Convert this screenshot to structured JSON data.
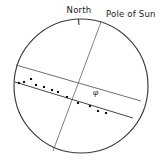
{
  "figure": {
    "name": "solar-disk-sunspot-diagram",
    "background_color": "#ffffff",
    "ink_color": "#2b2b2b"
  },
  "labels": {
    "north": "North",
    "pole_of_sun": "Pole of Sun",
    "angle_symbol": "φ"
  },
  "disk": {
    "center_x": 81,
    "center_y": 86,
    "radius": 67,
    "stroke_color": "#3a3a3a"
  },
  "north_tick": {
    "x": 78.5,
    "y_outer": 19,
    "y_inner": 25
  },
  "rotation_axis": {
    "label": "Pole of Sun",
    "x1": 101,
    "y1": 22,
    "x2": 53,
    "y2": 151,
    "stroke_color": "#6a6a6a"
  },
  "chord_upper": {
    "x1": 16,
    "y1": 65,
    "x2": 141,
    "y2": 101
  },
  "chord_lower_fit": {
    "x1": 15,
    "y1": 82,
    "x2": 133,
    "y2": 118
  },
  "angle_marker": {
    "vertex_x": 81,
    "vertex_y": 86,
    "arc_radius": 17,
    "symbol": "φ",
    "symbol_x": 98,
    "symbol_y": 93
  },
  "chart_data": {
    "type": "scatter",
    "title": "",
    "xlabel": "",
    "ylabel": "",
    "series": [
      {
        "name": "sunspots",
        "marker": "square",
        "marker_size": 2.1,
        "color": "#111111",
        "points": [
          {
            "x": 19,
            "y": 83
          },
          {
            "x": 24,
            "y": 82
          },
          {
            "x": 31,
            "y": 79
          },
          {
            "x": 36,
            "y": 85
          },
          {
            "x": 44,
            "y": 87
          },
          {
            "x": 52,
            "y": 90
          },
          {
            "x": 58,
            "y": 92
          },
          {
            "x": 67,
            "y": 97
          },
          {
            "x": 78,
            "y": 103
          },
          {
            "x": 90,
            "y": 106
          },
          {
            "x": 98,
            "y": 111
          },
          {
            "x": 106,
            "y": 113
          }
        ]
      }
    ],
    "reference_lines": [
      {
        "name": "equator-fit-line",
        "x1": 15,
        "y1": 82,
        "x2": 133,
        "y2": 118
      },
      {
        "name": "central-meridian-chord",
        "x1": 16,
        "y1": 65,
        "x2": 141,
        "y2": 101
      },
      {
        "name": "rotation-axis",
        "x1": 101,
        "y1": 22,
        "x2": 53,
        "y2": 151
      }
    ],
    "annotations": [
      {
        "text": "North",
        "x": 79,
        "y": 11
      },
      {
        "text": "Pole of Sun",
        "x": 106,
        "y": 14
      },
      {
        "text": "φ",
        "x": 98,
        "y": 93
      }
    ]
  }
}
